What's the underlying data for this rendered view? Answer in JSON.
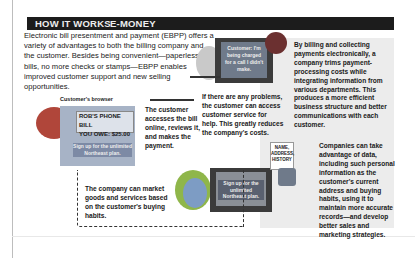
{
  "banner": {
    "section": "HOW IT WORKS",
    "topic": "E-MONEY"
  },
  "intro": "Electronic bill presentment and payment (EBPP) offers a variety of advantages to both the billing company and the customer. Besides being convenient—paperless bills, no more checks or stamps—EBPP enables improved customer support and new selling opportunities.",
  "browser": {
    "label": "Customer's browser",
    "bill_line1": "ROB'S PHONE BILL",
    "bill_line2": "YOU OWE: $25.00",
    "signup": "Sign up for the unlimited Northeast plan."
  },
  "service_screen": "Customer: I'm being charged for a call I didn't make.",
  "company_screen": "Sign up for the unlimited Northeast plan.",
  "data_tag": "NAME, ADDRESS, HISTORY",
  "captions": {
    "access": "The customer accesses the bill online, reviews it, and makes the payment.",
    "problems": "If there are any problems, the customer can access customer service for help. This greatly reduces the company's costs.",
    "billing": "By billing and collecting payments electronically, a company trims payment-processing costs while integrating information from various departments. This produces a more efficient business structure and better communications with each customer.",
    "data": "Companies can take advantage of data, including such personal information as the customer's current address and buying habits, using it to maintain more accurate records—and develop better sales and marketing strategies.",
    "market": "The company can market goods and services based on the customer's buying habits."
  },
  "colors": {
    "banner": "#1c1c1c",
    "panel": "#ececec",
    "head_red": "#b0463a",
    "head_blue": "#7d9cc4",
    "head_green": "#8fb64a"
  }
}
